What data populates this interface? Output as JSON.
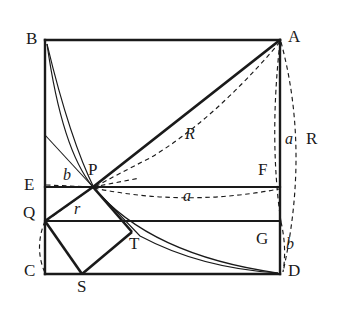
{
  "figure": {
    "stroke_color": "#1a1a1a",
    "background_color": "#ffffff",
    "geometry": {
      "rect": {
        "left": 45,
        "top": 40,
        "right": 280,
        "bottom": 274
      },
      "points": {
        "B": {
          "x": 45,
          "y": 40
        },
        "A": {
          "x": 280,
          "y": 40
        },
        "C": {
          "x": 45,
          "y": 274
        },
        "D": {
          "x": 280,
          "y": 274
        },
        "E": {
          "x": 45,
          "y": 187
        },
        "F": {
          "x": 280,
          "y": 187
        },
        "Q": {
          "x": 45,
          "y": 221
        },
        "G": {
          "x": 280,
          "y": 221
        },
        "P": {
          "x": 93,
          "y": 187
        },
        "S": {
          "x": 82,
          "y": 274
        },
        "T": {
          "x": 132,
          "y": 232
        },
        "Kleft": {
          "x": 45,
          "y": 135
        }
      }
    },
    "vertex_labels": [
      {
        "name": "label-B",
        "text": "B",
        "x": 26,
        "y": 30,
        "italic": false
      },
      {
        "name": "label-A",
        "text": "A",
        "x": 288,
        "y": 28,
        "italic": false
      },
      {
        "name": "label-E",
        "text": "E",
        "x": 24,
        "y": 176,
        "italic": false
      },
      {
        "name": "label-Q",
        "text": "Q",
        "x": 23,
        "y": 204,
        "italic": false
      },
      {
        "name": "label-C",
        "text": "C",
        "x": 24,
        "y": 262,
        "italic": false
      },
      {
        "name": "label-D",
        "text": "D",
        "x": 288,
        "y": 262,
        "italic": false
      },
      {
        "name": "label-F",
        "text": "F",
        "x": 258,
        "y": 161,
        "italic": false
      },
      {
        "name": "label-G",
        "text": "G",
        "x": 256,
        "y": 230,
        "italic": false
      },
      {
        "name": "label-P",
        "text": "P",
        "x": 88,
        "y": 161,
        "italic": false
      },
      {
        "name": "label-S",
        "text": "S",
        "x": 77,
        "y": 278,
        "italic": false
      },
      {
        "name": "label-T",
        "text": "T",
        "x": 129,
        "y": 235,
        "italic": false
      }
    ],
    "measure_labels": [
      {
        "name": "label-R-diagonal",
        "text": "R",
        "x": 185,
        "y": 126,
        "italic": true
      },
      {
        "name": "label-a-horizontal",
        "text": "a",
        "x": 183,
        "y": 188,
        "italic": true
      },
      {
        "name": "label-b-near-p",
        "text": "b",
        "x": 63,
        "y": 167,
        "italic": true
      },
      {
        "name": "label-r-incircle",
        "text": "r",
        "x": 74,
        "y": 201,
        "italic": true
      },
      {
        "name": "label-a-right-arc",
        "text": "a",
        "x": 285,
        "y": 131,
        "italic": true
      },
      {
        "name": "label-R-right-arc",
        "text": "R",
        "x": 306,
        "y": 130,
        "italic": false
      },
      {
        "name": "label-b-right-arc",
        "text": "b",
        "x": 286,
        "y": 236,
        "italic": true
      }
    ],
    "segments": {
      "rectangle_sides": [
        "B-A",
        "A-D",
        "D-C",
        "C-B"
      ],
      "horizontal_EF": "E-F",
      "horizontal_QG": "Q-G",
      "diagonal_AP_thick": "A-P",
      "square_PQST": [
        "P-Q",
        "Q-S",
        "S-T",
        "T-P"
      ],
      "thin_line_left_to_P": "Kleft-P"
    },
    "curves": {
      "solid_arc_B_to_D": "quadrant arc centred near C from B through P to D",
      "solid_arc_B_to_P_extended": "second thin arc from B sweeping through P",
      "dashed_arc_A_to_P_R": "dashed arc labelled R from A down to P",
      "dashed_arc_P_to_F_a": "dashed arc labelled a from P to F",
      "dashed_arc_A_to_G_a": "dashed vertical arc labelled a from A to G",
      "dashed_arc_A_to_D_R": "dashed outer arc labelled R from A to D",
      "dashed_arc_G_to_D_b": "dashed short arc labelled b from G to D",
      "dashed_arc_Q_to_C_b": "dashed short arc labelled b from Q to C",
      "dashed_chord_Q_to_P_r": "dashed chord labelled r from Q to P",
      "dashed_chord_E_to_P_b": "dashed chord labelled b from E to P"
    }
  }
}
